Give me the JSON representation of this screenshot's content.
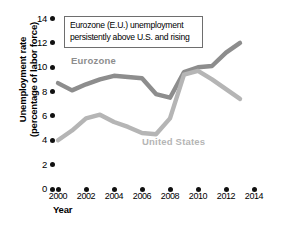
{
  "chart_data": {
    "type": "line",
    "title": "",
    "annotation": "Eurozone (E.U.) unemployment persistently above U.S. and rising",
    "annotation_line1": "Eurozone (E.U.) unemployment",
    "annotation_line2": "persistently above U.S. and rising",
    "xlabel": "Year",
    "ylabel": "Unemployment rate (percentage of labor force)",
    "ylabel_line1": "Unemployment rate",
    "ylabel_line2": "(percentage of labor force)",
    "xlim": [
      2000,
      2014
    ],
    "ylim": [
      0,
      14
    ],
    "xticks": [
      2000,
      2002,
      2004,
      2006,
      2008,
      2010,
      2012,
      2014
    ],
    "yticks": [
      0,
      2,
      4,
      6,
      8,
      10,
      12,
      14
    ],
    "grid": false,
    "legend": "inline-labels",
    "x": [
      2000,
      2001,
      2002,
      2003,
      2004,
      2005,
      2006,
      2007,
      2008,
      2009,
      2010,
      2011,
      2012,
      2013
    ],
    "series": [
      {
        "name": "Eurozone",
        "color": "#8d8d8d",
        "values": [
          8.7,
          8.1,
          8.6,
          9.0,
          9.3,
          9.2,
          9.1,
          7.8,
          7.5,
          9.6,
          10.0,
          10.1,
          11.2,
          12.0
        ]
      },
      {
        "name": "United States",
        "color": "#b5b5b5",
        "values": [
          4.0,
          4.8,
          5.8,
          6.1,
          5.5,
          5.1,
          4.6,
          4.5,
          5.8,
          9.4,
          9.7,
          9.0,
          8.2,
          7.4
        ]
      }
    ]
  },
  "colors": {
    "eurozone": "#8d8d8d",
    "united_states": "#b5b5b5",
    "axis_text": "#000000",
    "box_border": "#6e6e6e",
    "background": "#ffffff"
  }
}
